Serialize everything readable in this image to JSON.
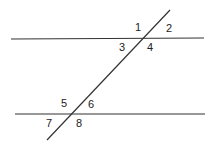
{
  "diagram": {
    "type": "parallel lines cut by a transversal",
    "line_color": "#333333",
    "angle_labels": [
      "1",
      "2",
      "3",
      "4",
      "5",
      "6",
      "7",
      "8"
    ]
  }
}
